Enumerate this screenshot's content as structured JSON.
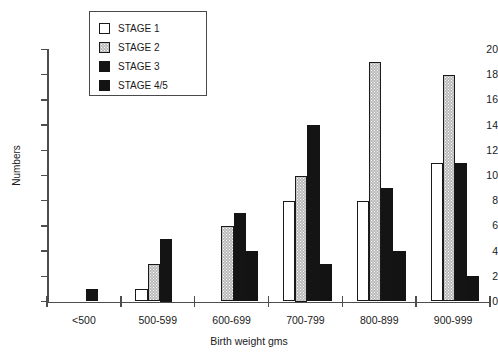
{
  "chart_data": {
    "type": "bar",
    "title": "",
    "xlabel": "Birth weight gms",
    "ylabel": "Numbers",
    "categories": [
      "<500",
      "500-599",
      "600-699",
      "700-799",
      "800-899",
      "900-999"
    ],
    "series": [
      {
        "name": "STAGE 1",
        "swatch": "white",
        "color": "#ffffff",
        "values": [
          0,
          1,
          0,
          8,
          8,
          11
        ]
      },
      {
        "name": "STAGE 2",
        "swatch": "dotted",
        "color": "#b9b9b9",
        "values": [
          0,
          3,
          6,
          10,
          19,
          18
        ]
      },
      {
        "name": "STAGE 3",
        "swatch": "black",
        "color": "#141414",
        "values": [
          1,
          5,
          7,
          14,
          9,
          11
        ]
      },
      {
        "name": "STAGE 4/5",
        "swatch": "black45",
        "color": "#131313",
        "values": [
          0,
          0,
          4,
          3,
          4,
          2
        ]
      }
    ],
    "ylim": [
      0,
      20
    ],
    "yticks": [
      0,
      2,
      4,
      6,
      8,
      10,
      12,
      14,
      16,
      18,
      20
    ],
    "grid": false,
    "legend_position": "top-left"
  }
}
